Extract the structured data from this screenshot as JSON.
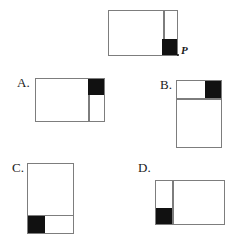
{
  "question": {
    "type": "multiple-choice-geometry",
    "stem": {
      "name": "reference-figure",
      "point_label": "P",
      "shape": "rectangle",
      "orientation": "landscape",
      "divider": "vertical-right",
      "shaded_square_corner": "bottom-right"
    },
    "options": [
      {
        "key": "A",
        "label": "A.",
        "shape": "rectangle",
        "orientation": "landscape",
        "divider": "vertical-right",
        "shaded_square_corner": "top-right"
      },
      {
        "key": "B",
        "label": "B.",
        "shape": "rectangle",
        "orientation": "portrait",
        "divider": "horizontal-top",
        "shaded_square_corner": "top-right"
      },
      {
        "key": "C",
        "label": "C.",
        "shape": "rectangle",
        "orientation": "portrait",
        "divider": "horizontal-bottom",
        "shaded_square_corner": "bottom-left"
      },
      {
        "key": "D",
        "label": "D.",
        "shape": "rectangle",
        "orientation": "landscape",
        "divider": "vertical-left",
        "shaded_square_corner": "bottom-left"
      }
    ]
  },
  "colors": {
    "shaded": "#111111",
    "outline": "#7d7d7d",
    "background": "#ffffff",
    "text": "#1a1a1a"
  }
}
